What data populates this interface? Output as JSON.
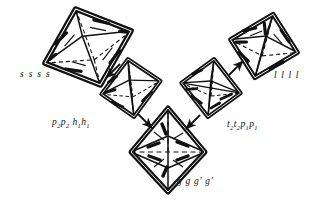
{
  "figure": {
    "kind": "crystal-form-diagram",
    "background_color": "#ffffff",
    "ink_color": "#111111",
    "shapes": [
      {
        "id": "octahedron-top-left",
        "name": "octahedron-ssss",
        "center": [
          88,
          47
        ],
        "rx": 48,
        "ry": 40,
        "rotation_deg": -18,
        "label": "ssss"
      },
      {
        "id": "octahedron-mid-left",
        "name": "octahedron-p2p2h1h1",
        "center": [
          131,
          88
        ],
        "rx": 31,
        "ry": 29,
        "rotation_deg": -8,
        "label": "p2p2h1h1"
      },
      {
        "id": "octahedron-bottom-center",
        "name": "octahedron-gggg",
        "center": [
          168,
          150
        ],
        "rx": 38,
        "ry": 42,
        "rotation_deg": 0,
        "label": "gggg"
      },
      {
        "id": "octahedron-mid-right",
        "name": "octahedron-t2t2p1p1",
        "center": [
          211,
          88
        ],
        "rx": 31,
        "ry": 29,
        "rotation_deg": 8,
        "label": "t2t2p1p1"
      },
      {
        "id": "octahedron-top-right",
        "name": "octahedron-llll",
        "center": [
          264,
          46
        ],
        "rx": 36,
        "ry": 34,
        "rotation_deg": 16,
        "label": "llll"
      }
    ],
    "labels": {
      "ssss": "s s s s",
      "llll": "l l l l",
      "p2p2h1h1_parts": [
        "p",
        "2",
        "p",
        "2",
        "h",
        "1",
        "h",
        "1"
      ],
      "t2t2p1p1_parts": [
        "t",
        "2",
        "t",
        "2",
        "p",
        "1",
        "p",
        "1"
      ],
      "gggg": "g g g' g'"
    },
    "arrows": [
      {
        "name": "arrow-ssss-to-p2p2",
        "from": [
          118,
          66
        ],
        "to": [
          104,
          80
        ]
      },
      {
        "name": "arrow-p2p2-to-gggg",
        "from": [
          139,
          117
        ],
        "to": [
          153,
          131
        ]
      },
      {
        "name": "arrow-gggg-to-t2t2",
        "from": [
          198,
          118
        ],
        "to": [
          185,
          131
        ]
      },
      {
        "name": "arrow-llll-to-t2t2",
        "from": [
          228,
          74
        ],
        "to": [
          241,
          61
        ]
      }
    ]
  }
}
